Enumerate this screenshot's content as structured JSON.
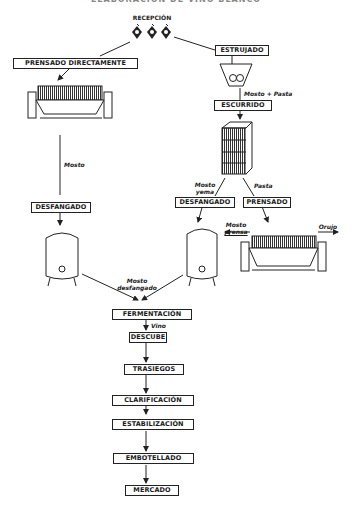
{
  "title": "ELABORACIÓN DE VINO BLANCO",
  "nodes": {
    "recepcion": "RECEPCIÓN",
    "prensado_directamente": "PRENSADO DIRECTAMENTE",
    "estrujado": "ESTRUJADO",
    "escurrido": "ESCURRIDO",
    "desfangado_left": "DESFANGADO",
    "desfangado_right": "DESFANGADO",
    "prensado": "PRENSADO",
    "fermentacion": "FERMENTACIÓN",
    "descube": "DESCUBE",
    "trasiegos": "TRASIEGOS",
    "clarificacion": "CLARIFICACIÓN",
    "estabilizacion": "ESTABILIZACIÓN",
    "embotellado": "EMBOTELLADO",
    "mercado": "MERCADO"
  },
  "labels": {
    "mosto": "Mosto",
    "mosto_pasta": "Mosto + Pasta",
    "mosto_yema_1": "Mosto",
    "mosto_yema_2": "yema",
    "pasta": "Pasta",
    "mosto_prensa_1": "Mosto",
    "mosto_prensa_2": "prensa",
    "orujo": "Orujo",
    "mosto_desfangado_1": "Mosto",
    "mosto_desfangado_2": "desfangado",
    "vino": "Vino"
  },
  "icons": [
    "grape-cluster-icon",
    "press-icon",
    "crusher-hopper-icon",
    "drainer-tank-icon",
    "settling-tank-icon"
  ]
}
